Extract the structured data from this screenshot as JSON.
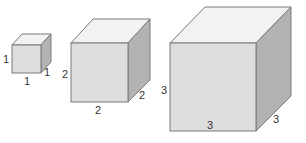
{
  "colors": {
    "front": "#dedede",
    "top": "#f2f2f2",
    "side": "#b3b3b3",
    "edge": "#7a7a7a",
    "label": "#333333"
  },
  "cubes": [
    {
      "name": "small",
      "edge_length": 1,
      "labels": {
        "height": "1",
        "width": "1",
        "depth": "1"
      }
    },
    {
      "name": "medium",
      "edge_length": 2,
      "labels": {
        "height": "2",
        "width": "2",
        "depth": "2"
      }
    },
    {
      "name": "large",
      "edge_length": 3,
      "labels": {
        "height": "3",
        "width": "3",
        "depth": "3"
      }
    }
  ]
}
